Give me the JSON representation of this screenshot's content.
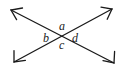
{
  "figure": {
    "background_color": "#ffffff",
    "stroke_color": "#1a1a1a",
    "stroke_width": 1.3,
    "width": 123,
    "height": 73
  },
  "labels": {
    "top": "a",
    "left": "b",
    "bottom": "c",
    "right": "d"
  },
  "lines": [
    {
      "name": "line-nw-se",
      "from_label": "arrow-northwest",
      "to_label": "arrow-southeast",
      "x1": 11,
      "y1": 10,
      "x2": 114,
      "y2": 63
    },
    {
      "name": "line-sw-ne",
      "from_label": "arrow-southwest",
      "to_label": "arrow-northeast",
      "x1": 14,
      "y1": 62,
      "x2": 112,
      "y2": 9
    }
  ],
  "intersection": {
    "x": 62,
    "y": 36
  },
  "arrowheads": [
    {
      "name": "arrow-northwest",
      "x": 11,
      "y": 10
    },
    {
      "name": "arrow-northeast",
      "x": 112,
      "y": 9
    },
    {
      "name": "arrow-southwest",
      "x": 14,
      "y": 62
    },
    {
      "name": "arrow-southeast",
      "x": 114,
      "y": 63
    }
  ]
}
